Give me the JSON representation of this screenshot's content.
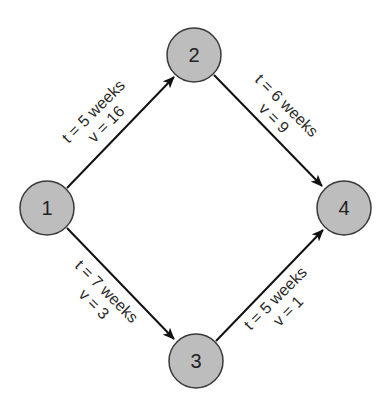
{
  "diagram": {
    "type": "network / activity-on-arrow (PERT) graph",
    "colors": {
      "node_fill": "#bdbdbd",
      "node_stroke": "#3a3a3a",
      "edge": "#111111",
      "text": "#2a2a2a",
      "background": "#ffffff"
    },
    "nodes": [
      {
        "id": "1",
        "label": "1",
        "cx": 47,
        "cy": 208
      },
      {
        "id": "2",
        "label": "2",
        "cx": 194,
        "cy": 55
      },
      {
        "id": "3",
        "label": "3",
        "cx": 196,
        "cy": 361
      },
      {
        "id": "4",
        "label": "4",
        "cx": 344,
        "cy": 208
      }
    ],
    "edges": [
      {
        "from": "1",
        "to": "2",
        "t_label": "t = 5 weeks",
        "v_label": "v = 16"
      },
      {
        "from": "2",
        "to": "4",
        "t_label": "t = 6 weeks",
        "v_label": "v = 9"
      },
      {
        "from": "1",
        "to": "3",
        "t_label": "t = 7 weeks",
        "v_label": "v = 3"
      },
      {
        "from": "3",
        "to": "4",
        "t_label": "t = 5 weeks",
        "v_label": "v = 1"
      }
    ]
  }
}
